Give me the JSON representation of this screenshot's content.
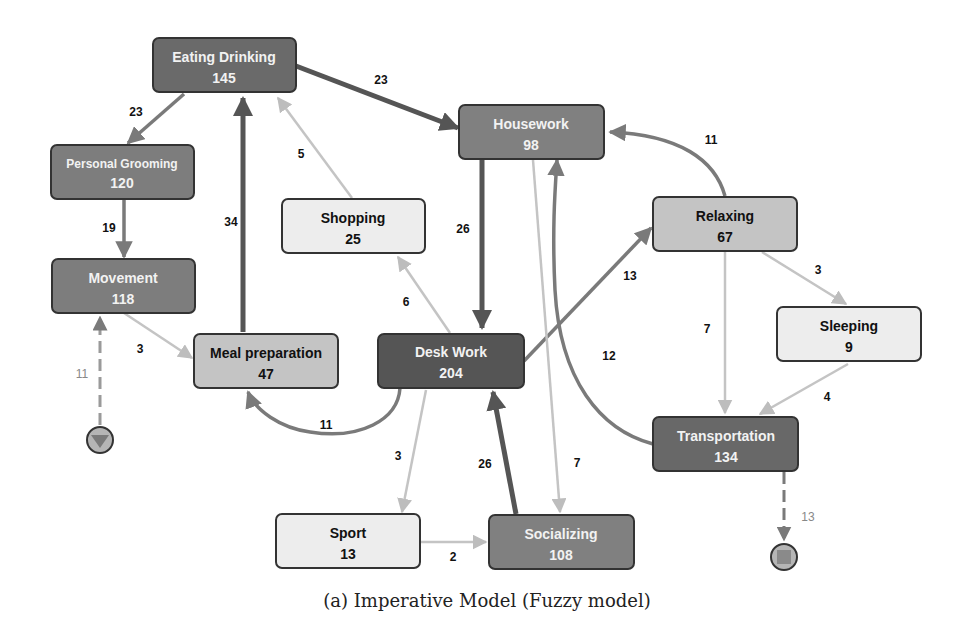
{
  "caption": "(a) Imperative Model (Fuzzy model)",
  "colors": {
    "dark": "#555555",
    "medium": "#808080",
    "light": "#c4c4c4",
    "lightest": "#ededed",
    "edge_dark": "#555555",
    "edge_medium": "#7a7a7a",
    "edge_light": "#bdbdbd"
  },
  "nodes": [
    {
      "id": "eating-drinking",
      "name": "Eating Drinking",
      "value": "145"
    },
    {
      "id": "personal-grooming",
      "name": "Personal Grooming",
      "value": "120"
    },
    {
      "id": "movement",
      "name": "Movement",
      "value": "118"
    },
    {
      "id": "shopping",
      "name": "Shopping",
      "value": "25"
    },
    {
      "id": "housework",
      "name": "Housework",
      "value": "98"
    },
    {
      "id": "relaxing",
      "name": "Relaxing",
      "value": "67"
    },
    {
      "id": "sleeping",
      "name": "Sleeping",
      "value": "9"
    },
    {
      "id": "meal-preparation",
      "name": "Meal preparation",
      "value": "47"
    },
    {
      "id": "desk-work",
      "name": "Desk Work",
      "value": "204"
    },
    {
      "id": "transportation",
      "name": "Transportation",
      "value": "134"
    },
    {
      "id": "sport",
      "name": "Sport",
      "value": "13"
    },
    {
      "id": "socializing",
      "name": "Socializing",
      "value": "108"
    }
  ],
  "edges": [
    {
      "from": "Eating Drinking",
      "to": "Housework",
      "label": "23"
    },
    {
      "from": "Eating Drinking",
      "to": "Personal Grooming",
      "label": "23"
    },
    {
      "from": "Personal Grooming",
      "to": "Movement",
      "label": "19"
    },
    {
      "from": "Meal preparation",
      "to": "Eating Drinking",
      "label": "34"
    },
    {
      "from": "Shopping",
      "to": "Eating Drinking",
      "label": "5"
    },
    {
      "from": "Housework",
      "to": "Desk Work",
      "label": "26"
    },
    {
      "from": "Relaxing",
      "to": "Housework",
      "label": "11"
    },
    {
      "from": "Desk Work",
      "to": "Shopping",
      "label": "6"
    },
    {
      "from": "Desk Work",
      "to": "Relaxing",
      "label": "13"
    },
    {
      "from": "Relaxing",
      "to": "Sleeping",
      "label": "3"
    },
    {
      "from": "Relaxing",
      "to": "Transportation",
      "label": "7"
    },
    {
      "from": "Transportation",
      "to": "Housework",
      "label": "12"
    },
    {
      "from": "Movement",
      "to": "Meal preparation",
      "label": "3"
    },
    {
      "from": "start",
      "to": "Movement",
      "label": "11"
    },
    {
      "from": "Desk Work",
      "to": "Meal preparation",
      "label": "11"
    },
    {
      "from": "Desk Work",
      "to": "Sport",
      "label": "3"
    },
    {
      "from": "Socializing",
      "to": "Desk Work",
      "label": "26"
    },
    {
      "from": "Housework",
      "to": "Socializing",
      "label": "7"
    },
    {
      "from": "Sleeping",
      "to": "Transportation",
      "label": "4"
    },
    {
      "from": "Sport",
      "to": "Socializing",
      "label": "2"
    },
    {
      "from": "Transportation",
      "to": "end",
      "label": "13"
    }
  ]
}
